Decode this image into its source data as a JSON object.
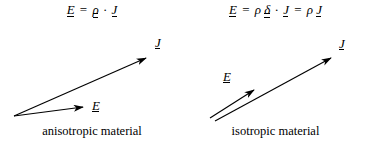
{
  "figure": {
    "width": 367,
    "height": 147,
    "background_color": "#ffffff",
    "ink_color": "#000000"
  },
  "panels": [
    {
      "id": "anisotropic",
      "caption": "anisotropic material",
      "formula": {
        "full_text": "E = ρ · J",
        "lhs_vector": "E",
        "equals": "=",
        "tensor": "ρ",
        "dot": "·",
        "rhs_vector": "J"
      },
      "vectors": [
        {
          "name": "J",
          "label": "J",
          "notation": "underlined-vector",
          "origin": [
            14,
            116
          ],
          "tip": [
            148,
            57
          ]
        },
        {
          "name": "E",
          "label": "E",
          "notation": "underlined-vector",
          "origin": [
            14,
            116
          ],
          "tip": [
            85,
            106
          ]
        }
      ],
      "note": "E and J are not parallel"
    },
    {
      "id": "isotropic",
      "caption": "isotropic material",
      "formula": {
        "full_text": "E = ρδ · J = ρJ",
        "lhs_vector": "E",
        "equals": "=",
        "scalar": "ρ",
        "tensor": "δ",
        "dot": "·",
        "rhs_vector": "J",
        "equals2": "=",
        "scalar2": "ρ",
        "rhs_vector2": "J"
      },
      "vectors": [
        {
          "name": "J",
          "label": "J",
          "notation": "underlined-vector",
          "origin": [
            31,
            120
          ],
          "tip": [
            149,
            56
          ]
        },
        {
          "name": "E",
          "label": "E",
          "notation": "underlined-vector",
          "origin": [
            26,
            118
          ],
          "tip": [
            72,
            88
          ]
        }
      ],
      "note": "E and J are parallel"
    }
  ]
}
